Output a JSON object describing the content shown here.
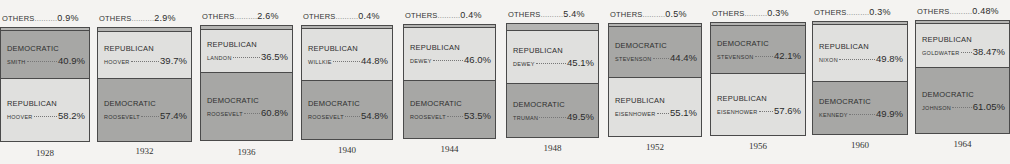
{
  "chart_data": {
    "type": "bar",
    "stacked": true,
    "title": "",
    "xlabel": "",
    "ylabel": "",
    "categories": [
      "1928",
      "1932",
      "1936",
      "1940",
      "1944",
      "1948",
      "1952",
      "1956",
      "1960",
      "1964"
    ],
    "series": [
      {
        "name": "Others",
        "values": [
          0.9,
          2.9,
          2.6,
          0.4,
          0.4,
          5.4,
          0.5,
          0.3,
          0.3,
          0.48
        ]
      },
      {
        "name": "Democratic",
        "values": [
          40.9,
          57.4,
          60.8,
          54.8,
          53.5,
          49.5,
          44.4,
          42.1,
          49.9,
          61.05
        ]
      },
      {
        "name": "Republican",
        "values": [
          58.2,
          39.7,
          36.5,
          44.8,
          46.0,
          45.1,
          55.1,
          57.6,
          49.8,
          38.47
        ]
      }
    ],
    "colors": {
      "democratic": "#a7a7a5",
      "republican": "#e0e0de",
      "others": "#b4b4b2",
      "border": "#4a4a4a"
    },
    "legend": "none",
    "grid": false
  },
  "years": [
    {
      "year": "1928",
      "others_label": "OTHERS",
      "others_pct": "0.9%",
      "upper": {
        "party": "DEMOCRATIC",
        "candidate": "SMITH",
        "pct": "40.9%",
        "side": "dem"
      },
      "lower": {
        "party": "REPUBLICAN",
        "candidate": "HOOVER",
        "pct": "58.2%",
        "side": "rep"
      }
    },
    {
      "year": "1932",
      "others_label": "OTHERS",
      "others_pct": "2.9%",
      "upper": {
        "party": "REPUBLICAN",
        "candidate": "HOOVER",
        "pct": "39.7%",
        "side": "rep"
      },
      "lower": {
        "party": "DEMOCRATIC",
        "candidate": "ROOSEVELT",
        "pct": "57.4%",
        "side": "dem"
      }
    },
    {
      "year": "1936",
      "others_label": "OTHERS",
      "others_pct": "2.6%",
      "upper": {
        "party": "REPUBLICAN",
        "candidate": "LANDON",
        "pct": "36.5%",
        "side": "rep"
      },
      "lower": {
        "party": "DEMOCRATIC",
        "candidate": "ROOSEVELT",
        "pct": "60.8%",
        "side": "dem"
      }
    },
    {
      "year": "1940",
      "others_label": "OTHERS",
      "others_pct": "0.4%",
      "upper": {
        "party": "REPUBLICAN",
        "candidate": "WILLKIE",
        "pct": "44.8%",
        "side": "rep"
      },
      "lower": {
        "party": "DEMOCRATIC",
        "candidate": "ROOSEVELT",
        "pct": "54.8%",
        "side": "dem"
      }
    },
    {
      "year": "1944",
      "others_label": "OTHERS",
      "others_pct": "0.4%",
      "upper": {
        "party": "REPUBLICAN",
        "candidate": "DEWEY",
        "pct": "46.0%",
        "side": "rep"
      },
      "lower": {
        "party": "DEMOCRATIC",
        "candidate": "ROOSEVELT",
        "pct": "53.5%",
        "side": "dem"
      }
    },
    {
      "year": "1948",
      "others_label": "OTHERS",
      "others_pct": "5.4%",
      "upper": {
        "party": "REPUBLICAN",
        "candidate": "DEWEY",
        "pct": "45.1%",
        "side": "rep"
      },
      "lower": {
        "party": "DEMOCRATIC",
        "candidate": "TRUMAN",
        "pct": "49.5%",
        "side": "dem"
      }
    },
    {
      "year": "1952",
      "others_label": "OTHERS",
      "others_pct": "0.5%",
      "upper": {
        "party": "DEMOCRATIC",
        "candidate": "STEVENSON",
        "pct": "44.4%",
        "side": "dem"
      },
      "lower": {
        "party": "REPUBLICAN",
        "candidate": "EISENHOWER",
        "pct": "55.1%",
        "side": "rep"
      }
    },
    {
      "year": "1956",
      "others_label": "OTHERS",
      "others_pct": "0.3%",
      "upper": {
        "party": "DEMOCRATIC",
        "candidate": "STEVENSON",
        "pct": "42.1%",
        "side": "dem"
      },
      "lower": {
        "party": "REPUBLICAN",
        "candidate": "EISENHOWER",
        "pct": "57.6%",
        "side": "rep"
      }
    },
    {
      "year": "1960",
      "others_label": "OTHERS",
      "others_pct": "0.3%",
      "upper": {
        "party": "REPUBLICAN",
        "candidate": "NIXON",
        "pct": "49.8%",
        "side": "rep"
      },
      "lower": {
        "party": "DEMOCRATIC",
        "candidate": "KENNEDY",
        "pct": "49.9%",
        "side": "dem"
      }
    },
    {
      "year": "1964",
      "others_label": "OTHERS",
      "others_pct": "0.48%",
      "upper": {
        "party": "REPUBLICAN",
        "candidate": "GOLDWATER",
        "pct": "38.47%",
        "side": "rep"
      },
      "lower": {
        "party": "DEMOCRATIC",
        "candidate": "JOHNSON",
        "pct": "61.05%",
        "side": "dem"
      }
    }
  ]
}
